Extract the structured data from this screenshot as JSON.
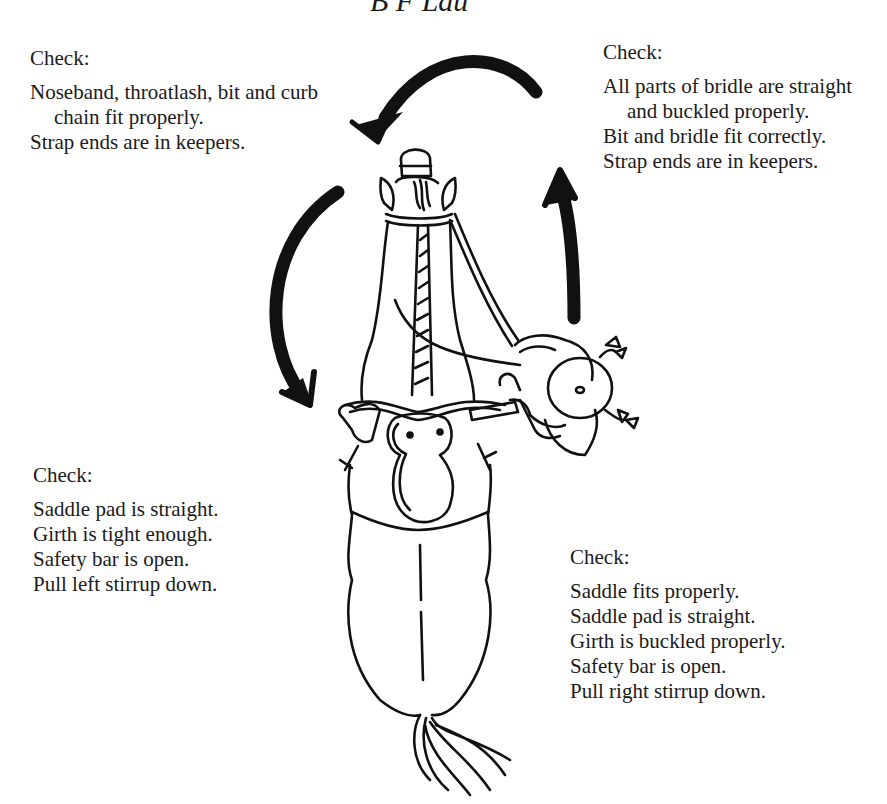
{
  "header": {
    "fragment": "B F Lau"
  },
  "checklists": {
    "top_left": {
      "heading": "Check:",
      "items": [
        "Noseband, throatlash, bit and curb chain fit properly.",
        "Strap ends are in keepers."
      ]
    },
    "top_right": {
      "heading": "Check:",
      "items": [
        "All parts of bridle are straight and buckled properly.",
        "Bit and bridle fit correctly.",
        "Strap ends are in keepers."
      ]
    },
    "bottom_left": {
      "heading": "Check:",
      "items": [
        "Saddle pad is straight.",
        "Girth is tight enough.",
        "Safety bar is open.",
        "Pull left stirrup down."
      ]
    },
    "bottom_right": {
      "heading": "Check:",
      "items": [
        "Saddle fits properly.",
        "Saddle pad is straight.",
        "Girth is buckled properly.",
        "Safety bar is open.",
        "Pull right stirrup down."
      ]
    }
  },
  "illustration": {
    "subject": "Overhead view of a saddled horse with a rider (girl with pigtails) checking tack, arrows showing clockwise inspection order",
    "ink_color": "#111111"
  }
}
